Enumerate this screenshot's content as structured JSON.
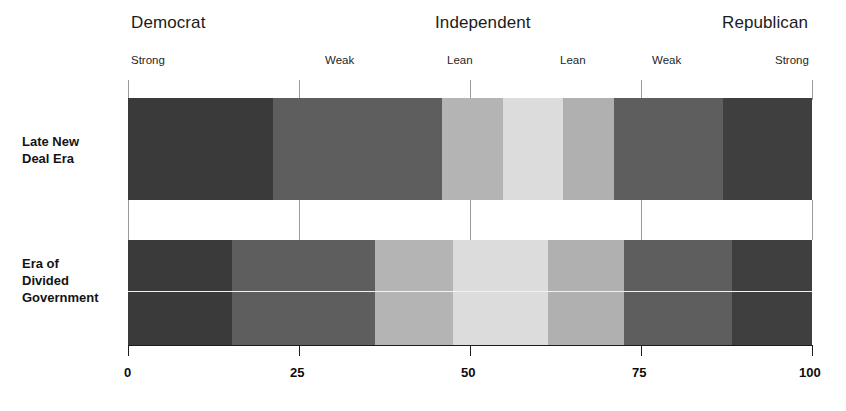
{
  "chart_data": {
    "type": "bar",
    "orientation": "horizontal-stacked",
    "title": "",
    "subtitle": "",
    "xlabel": "",
    "ylabel": "",
    "xlim": [
      0,
      100
    ],
    "grid": true,
    "legend_position": "top",
    "x_ticks": [
      0,
      25,
      50,
      75,
      100
    ],
    "x_tick_labels": [
      "0",
      "25",
      "50",
      "75",
      "100"
    ],
    "group_headings": [
      {
        "label": "Democrat",
        "at": 0
      },
      {
        "label": "Independent",
        "at": 50
      },
      {
        "label": "Republican",
        "at": 100
      }
    ],
    "sub_headings": [
      {
        "label": "Strong",
        "at": 0
      },
      {
        "label": "Weak",
        "at": 25
      },
      {
        "label": "Lean",
        "at": 46
      },
      {
        "label": "Lean",
        "at": 60
      },
      {
        "label": "Weak",
        "at": 75
      },
      {
        "label": "Strong",
        "at": 97
      }
    ],
    "categories": [
      "Late New\nDeal Era",
      "Era of\nDivided\nGovernment"
    ],
    "series": [
      {
        "name": "Strong Democrat",
        "values": [
          21.2,
          15.2
        ],
        "color": "#3a3a3a"
      },
      {
        "name": "Weak Democrat",
        "values": [
          24.7,
          20.9
        ],
        "color": "#5e5e5e"
      },
      {
        "name": "Lean Democrat",
        "values": [
          8.9,
          11.4
        ],
        "color": "#b4b4b4"
      },
      {
        "name": "Independent",
        "values": [
          8.8,
          13.9
        ],
        "color": "#dcdcdc"
      },
      {
        "name": "Lean Republican",
        "values": [
          7.5,
          11.1
        ],
        "color": "#b0b0b0"
      },
      {
        "name": "Weak Republican",
        "values": [
          15.9,
          15.8
        ],
        "color": "#5e5e5e"
      },
      {
        "name": "Strong Republican",
        "values": [
          13.0,
          11.7
        ],
        "color": "#3f3f3f"
      }
    ]
  },
  "headings": {
    "democrat": "Democrat",
    "independent": "Independent",
    "republican": "Republican"
  },
  "sub": {
    "strong_dem": "Strong",
    "weak_dem": "Weak",
    "lean_dem": "Lean",
    "lean_rep": "Lean",
    "weak_rep": "Weak",
    "strong_rep": "Strong"
  },
  "rows": {
    "row1": "Late New\nDeal Era",
    "row2": "Era of\nDivided\nGovernment"
  },
  "axis": {
    "t0": "0",
    "t25": "25",
    "t50": "50",
    "t75": "75",
    "t100": "100"
  }
}
